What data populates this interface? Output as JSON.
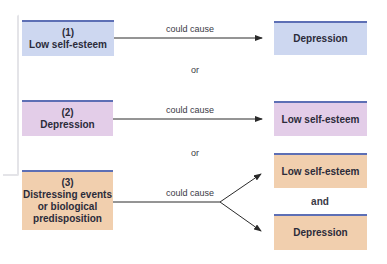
{
  "diagram": {
    "colors": {
      "scenario1": "#cdd7f0",
      "scenario2": "#e3cde8",
      "scenario3": "#f1cfae",
      "box_top_border": "#5d6fb5",
      "arrow": "#2a2a2a"
    },
    "scenarios": [
      {
        "number": "(1)",
        "cause": "Low self-esteem",
        "relation": "could cause",
        "effects": [
          "Depression"
        ]
      },
      {
        "number": "(2)",
        "cause": "Depression",
        "relation": "could cause",
        "effects": [
          "Low self-esteem"
        ]
      },
      {
        "number": "(3)",
        "cause_lines": [
          "Distressing events",
          "or biological",
          "predisposition"
        ],
        "relation": "could cause",
        "effects": [
          "Low self-esteem",
          "Depression"
        ],
        "effects_joiner": "and"
      }
    ],
    "separators": [
      "or",
      "or"
    ]
  }
}
